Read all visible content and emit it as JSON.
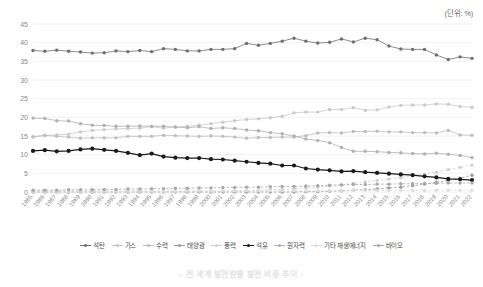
{
  "unit_label": "(단위: %)",
  "footer_title": "전 세계 발전원별 발전 비중 추이",
  "legend": {
    "items": [
      {
        "label": "석탄",
        "color": "#6e6e6e"
      },
      {
        "label": "가스",
        "color": "#c9c9c9"
      },
      {
        "label": "수력",
        "color": "#bdbdbd"
      },
      {
        "label": "태양광",
        "color": "#9a9a9a"
      },
      {
        "label": "풍력",
        "color": "#cfcfcf"
      },
      {
        "label": "석유",
        "color": "#1a1a1a"
      },
      {
        "label": "원자력",
        "color": "#b0b0b0"
      },
      {
        "label": "기타 재생에너지",
        "color": "#dcdcdc"
      },
      {
        "label": "바이오",
        "color": "#a8a8a8"
      }
    ]
  },
  "chart_data": {
    "type": "line",
    "title": "전 세계 발전원별 발전 비중 추이",
    "xlabel": "",
    "ylabel": "",
    "unit": "%",
    "ylim": [
      0,
      45
    ],
    "yticks": [
      0,
      5,
      10,
      15,
      20,
      25,
      30,
      35,
      40,
      45
    ],
    "grid": true,
    "legend_position": "bottom",
    "categories": [
      "1985",
      "1986",
      "1987",
      "1988",
      "1989",
      "1990",
      "1991",
      "1992",
      "1993",
      "1994",
      "1995",
      "1996",
      "1997",
      "1998",
      "1999",
      "2000",
      "2001",
      "2002",
      "2003",
      "2004",
      "2005",
      "2006",
      "2007",
      "2008",
      "2009",
      "2010",
      "2011",
      "2012",
      "2013",
      "2014",
      "2015",
      "2016",
      "2017",
      "2018",
      "2019",
      "2020",
      "2021",
      "2022"
    ],
    "series": [
      {
        "name": "석탄",
        "color": "#6e6e6e",
        "values": [
          37.9,
          37.7,
          38.0,
          37.7,
          37.5,
          37.2,
          37.3,
          37.8,
          37.6,
          37.9,
          37.6,
          38.4,
          38.2,
          37.8,
          37.8,
          38.2,
          38.2,
          38.4,
          39.8,
          39.3,
          39.8,
          40.4,
          41.2,
          40.4,
          39.9,
          40.1,
          41.0,
          40.2,
          41.2,
          40.8,
          39.1,
          38.3,
          38.2,
          38.2,
          36.7,
          35.5,
          36.2,
          35.8
        ]
      },
      {
        "name": "가스",
        "color": "#c9c9c9",
        "values": [
          14.7,
          15.1,
          15.3,
          15.5,
          16.1,
          16.5,
          16.7,
          16.9,
          17.0,
          17.1,
          17.5,
          17.1,
          17.4,
          17.6,
          17.9,
          18.3,
          18.7,
          19.1,
          19.4,
          19.6,
          19.9,
          20.3,
          21.2,
          21.4,
          21.4,
          22.1,
          22.1,
          22.6,
          21.9,
          22.0,
          22.8,
          23.2,
          23.3,
          23.3,
          23.6,
          23.5,
          22.9,
          22.7
        ]
      },
      {
        "name": "수력",
        "color": "#bdbdbd",
        "values": [
          14.8,
          15.2,
          14.9,
          14.7,
          14.4,
          14.5,
          14.5,
          14.5,
          14.9,
          14.9,
          14.9,
          15.2,
          15.1,
          15.0,
          14.9,
          15.0,
          14.9,
          14.7,
          14.4,
          14.6,
          14.6,
          14.7,
          14.7,
          15.1,
          15.8,
          15.9,
          15.8,
          16.2,
          16.2,
          16.3,
          16.1,
          16.1,
          15.9,
          15.9,
          15.8,
          16.5,
          15.3,
          15.2
        ]
      },
      {
        "name": "태양광",
        "color": "#9a9a9a",
        "values": [
          0.0,
          0.0,
          0.0,
          0.0,
          0.0,
          0.0,
          0.0,
          0.0,
          0.0,
          0.0,
          0.0,
          0.0,
          0.0,
          0.0,
          0.0,
          0.0,
          0.0,
          0.0,
          0.0,
          0.0,
          0.0,
          0.0,
          0.0,
          0.1,
          0.1,
          0.2,
          0.3,
          0.5,
          0.6,
          0.8,
          1.1,
          1.3,
          1.7,
          2.1,
          2.6,
          3.1,
          3.7,
          4.5
        ]
      },
      {
        "name": "풍력",
        "color": "#cfcfcf",
        "values": [
          0.0,
          0.0,
          0.0,
          0.0,
          0.0,
          0.0,
          0.0,
          0.0,
          0.1,
          0.1,
          0.1,
          0.1,
          0.1,
          0.2,
          0.2,
          0.2,
          0.3,
          0.3,
          0.4,
          0.5,
          0.6,
          0.7,
          0.9,
          1.1,
          1.3,
          1.6,
          1.9,
          2.3,
          2.7,
          3.1,
          3.5,
          3.9,
          4.4,
          4.8,
          5.3,
          6.0,
          6.6,
          7.2
        ]
      },
      {
        "name": "석유",
        "color": "#1a1a1a",
        "values": [
          11.0,
          11.2,
          10.9,
          11.0,
          11.4,
          11.6,
          11.3,
          11.0,
          10.5,
          9.9,
          10.3,
          9.5,
          9.2,
          9.1,
          9.1,
          8.8,
          8.7,
          8.4,
          8.1,
          7.8,
          7.6,
          7.1,
          7.1,
          6.3,
          6.0,
          5.8,
          5.5,
          5.6,
          5.3,
          5.1,
          4.9,
          4.7,
          4.5,
          4.2,
          3.9,
          3.5,
          3.4,
          3.2
        ]
      },
      {
        "name": "원자력",
        "color": "#b0b0b0",
        "values": [
          19.8,
          19.7,
          19.1,
          19.0,
          18.3,
          17.9,
          17.8,
          17.6,
          17.6,
          17.7,
          17.6,
          17.6,
          17.4,
          17.2,
          17.5,
          17.0,
          17.2,
          17.0,
          16.6,
          16.4,
          15.9,
          15.6,
          15.0,
          14.2,
          13.8,
          13.2,
          11.9,
          10.9,
          10.9,
          10.8,
          10.6,
          10.5,
          10.3,
          10.2,
          10.4,
          10.1,
          9.8,
          9.2
        ]
      },
      {
        "name": "기타 재생에너지",
        "color": "#dcdcdc",
        "values": [
          0.3,
          0.3,
          0.3,
          0.3,
          0.3,
          0.3,
          0.3,
          0.3,
          0.3,
          0.3,
          0.3,
          0.3,
          0.3,
          0.3,
          0.3,
          0.3,
          0.3,
          0.3,
          0.3,
          0.3,
          0.3,
          0.3,
          0.3,
          0.3,
          0.3,
          0.3,
          0.3,
          0.4,
          0.4,
          0.4,
          0.4,
          0.4,
          0.4,
          0.4,
          0.5,
          0.5,
          0.5,
          0.5
        ]
      },
      {
        "name": "바이오",
        "color": "#a8a8a8",
        "values": [
          0.5,
          0.5,
          0.5,
          0.6,
          0.6,
          0.6,
          0.7,
          0.7,
          0.8,
          0.8,
          0.9,
          0.9,
          1.0,
          1.0,
          1.1,
          1.1,
          1.2,
          1.2,
          1.3,
          1.3,
          1.4,
          1.5,
          1.5,
          1.6,
          1.7,
          1.8,
          1.9,
          2.0,
          2.0,
          2.1,
          2.1,
          2.2,
          2.2,
          2.3,
          2.3,
          2.4,
          2.4,
          2.4
        ]
      }
    ]
  }
}
